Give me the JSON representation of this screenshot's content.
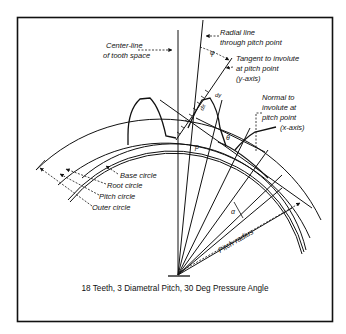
{
  "figure": {
    "caption": "18 Teeth, 3 Diametral Pitch, 30 Deg Pressure Angle",
    "colors": {
      "ink": "#111111",
      "background": "#ffffff"
    },
    "labels": {
      "center_line_1": "Center-line",
      "center_line_2": "of tooth space",
      "radial_line_1": "Radial line",
      "radial_line_2": "through pitch point",
      "tangent_1": "Tangent to involute",
      "tangent_2": "at pitch point",
      "tangent_3": "(y-axis)",
      "normal_1": "Normal to",
      "normal_2": "involute at",
      "normal_3": "pitch point",
      "normal_4": "(x-axis)",
      "base_circle": "Base circle",
      "root_circle": "Root circle",
      "pitch_circle": "Pitch circle",
      "outer_circle": "Outer circle",
      "pitch_radius": "Pitch radius"
    },
    "symbols": {
      "phi": "φ",
      "theta": "θ",
      "alpha": "α",
      "rho": "ρ",
      "dx": "dx",
      "dy": "dy"
    }
  }
}
